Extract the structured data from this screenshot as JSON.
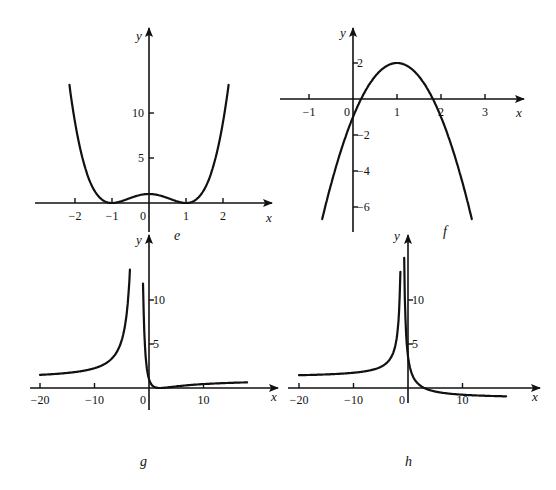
{
  "chart_data": [
    {
      "type": "line",
      "panel_label": "e",
      "function_shape": "quartic with double roots",
      "xlabel": "x",
      "ylabel": "y",
      "xlim": [
        -2.15,
        2.15
      ],
      "x_ticks": [
        -2,
        -1,
        0,
        1,
        2
      ],
      "x_tick_labels": [
        "−2",
        "−1",
        "0",
        "1",
        "2"
      ],
      "y_ticks": [
        5,
        10
      ],
      "y_tick_labels": [
        "5",
        "10"
      ],
      "series": [
        {
          "name": "e",
          "x": [
            -2.15,
            -2,
            -1.75,
            -1.5,
            -1.25,
            -1,
            -0.75,
            -0.5,
            -0.25,
            0,
            0.25,
            0.5,
            0.75,
            1,
            1.25,
            1.5,
            1.75,
            2,
            2.15
          ],
          "y": [
            13.0,
            9.0,
            4.25,
            1.56,
            0.32,
            0,
            0.19,
            0.56,
            0.88,
            1,
            0.88,
            0.56,
            0.19,
            0,
            0.32,
            1.56,
            4.25,
            9.0,
            13.0
          ]
        }
      ]
    },
    {
      "type": "line",
      "panel_label": "f",
      "function_shape": "downward parabola, vertex (1, 2)",
      "xlabel": "x",
      "ylabel": "y",
      "xlim": [
        -0.7,
        2.7
      ],
      "x_ticks": [
        -1,
        0,
        1,
        2,
        3
      ],
      "x_tick_labels": [
        "−1",
        "0",
        "1",
        "2",
        "3"
      ],
      "y_ticks": [
        2,
        -2,
        -4,
        -6
      ],
      "y_tick_labels": [
        "2",
        "−2",
        "−4",
        "−6"
      ],
      "series": [
        {
          "name": "f",
          "x": [
            -0.7,
            -0.5,
            0,
            0.5,
            1,
            1.5,
            2,
            2.5,
            2.7
          ],
          "y": [
            -6.67,
            -4.75,
            -1,
            1.25,
            2,
            1.25,
            -1,
            -4.75,
            -6.67
          ]
        }
      ]
    },
    {
      "type": "line",
      "panel_label": "g",
      "function_shape": "vertical asymptote near x = -2, horizontal asymptote y = 1",
      "xlabel": "x",
      "ylabel": "y",
      "xlim": [
        -20,
        18
      ],
      "x_ticks": [
        -20,
        -10,
        0,
        10
      ],
      "x_tick_labels": [
        "−20",
        "−10",
        "0",
        "10"
      ],
      "y_ticks": [
        5,
        10
      ],
      "y_tick_labels": [
        "5",
        "10"
      ],
      "series": [
        {
          "name": "g",
          "x": [
            -20,
            -15,
            -10,
            -6,
            -4,
            -3.5
          ],
          "y": [
            1.49,
            1.72,
            2.25,
            4.0,
            9.0,
            12.3
          ]
        },
        {
          "name": "g-right",
          "x": [
            -1.1,
            -0.5,
            0,
            1,
            2,
            4,
            8,
            12,
            18
          ],
          "y": [
            12.3,
            4.0,
            1.0,
            0.11,
            0,
            0.11,
            0.36,
            0.51,
            0.64
          ]
        }
      ]
    },
    {
      "type": "line",
      "panel_label": "h",
      "function_shape": "vertical asymptote near x = -1",
      "xlabel": "x",
      "ylabel": "y",
      "xlim": [
        -20,
        18
      ],
      "x_ticks": [
        -20,
        -10,
        0,
        10
      ],
      "x_tick_labels": [
        "−20",
        "−10",
        "0",
        "10"
      ],
      "y_ticks": [
        5,
        10
      ],
      "y_tick_labels": [
        "5",
        "10"
      ],
      "series": [
        {
          "name": "h",
          "x": [
            -20,
            -15,
            -10,
            -5,
            -3,
            -1.4
          ],
          "y": [
            1.45,
            1.5,
            1.73,
            2.4,
            3.6,
            13.2
          ]
        },
        {
          "name": "h-right",
          "x": [
            -0.7,
            0,
            1,
            3,
            6,
            10,
            18
          ],
          "y": [
            14.8,
            3.6,
            1.2,
            0,
            -0.51,
            -0.76,
            -0.95
          ]
        }
      ]
    }
  ]
}
